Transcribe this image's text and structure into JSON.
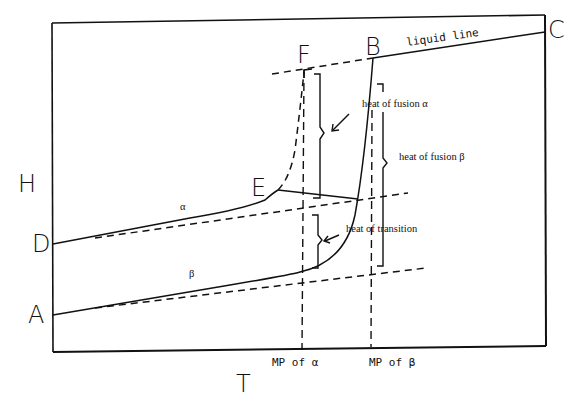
{
  "diagram": {
    "axes": {
      "y_label": "H",
      "x_label": "T"
    },
    "points": {
      "A": "A",
      "B": "B",
      "C": "C",
      "D": "D",
      "E": "E",
      "F": "F"
    },
    "curve_labels": {
      "alpha": "α",
      "beta": "β",
      "liquid": "liquid line"
    },
    "annotations": {
      "heat_of_fusion_alpha": "heat of fusion α",
      "heat_of_fusion_beta": "heat of fusion β",
      "heat_of_transition": "heat of transition"
    },
    "x_markers": {
      "mp_alpha": "MP of α",
      "mp_beta": "MP of β"
    },
    "colors": {
      "ink": "#111111",
      "background": "#ffffff"
    }
  }
}
